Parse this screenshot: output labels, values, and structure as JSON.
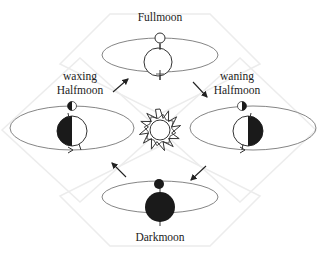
{
  "diagram": {
    "title": "",
    "center": {
      "label": "",
      "icon": "sun-icon"
    },
    "phases": [
      {
        "id": "full",
        "label_lines": [
          "Fullmoon"
        ],
        "position": "top",
        "moon": "full",
        "earth": "lit-all"
      },
      {
        "id": "waning",
        "label_lines": [
          "waning",
          "Halfmoon"
        ],
        "position": "right",
        "moon": "half-right-dark",
        "earth": "right-dark"
      },
      {
        "id": "dark",
        "label_lines": [
          "Darkmoon"
        ],
        "position": "bottom",
        "moon": "dark",
        "earth": "dark"
      },
      {
        "id": "waxing",
        "label_lines": [
          "waxing",
          "Halfmoon"
        ],
        "position": "left",
        "moon": "half-left-dark",
        "earth": "left-dark"
      }
    ],
    "cycle_direction": "clockwise",
    "colors": {
      "ink": "#222222",
      "orbit": "#555555",
      "diamond": "#eeeeee",
      "fill_dark": "#1a1a1a"
    }
  }
}
